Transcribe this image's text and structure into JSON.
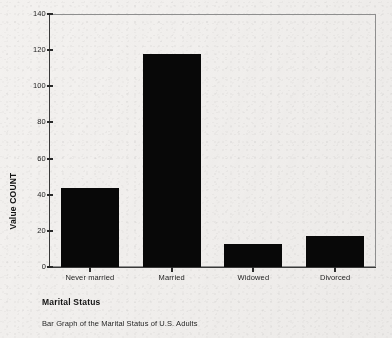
{
  "chart_data": {
    "type": "bar",
    "title": "",
    "caption": "Bar Graph of the Marital Status of U.S. Adults",
    "xlabel": "Marital Status",
    "ylabel": "Value COUNT",
    "categories": [
      "Never married",
      "Married",
      "Widowed",
      "Divorced"
    ],
    "values": [
      44,
      118,
      13,
      17
    ],
    "ylim": [
      0,
      140
    ],
    "yticks": [
      0,
      20,
      40,
      60,
      80,
      100,
      120,
      140
    ],
    "ytick_labels": [
      "0",
      "20",
      "40",
      "60",
      "80",
      "100",
      "120",
      "140"
    ],
    "grid": false,
    "legend": false,
    "bar_color": "#080808",
    "axis_color": "#3a3a3a",
    "frame_color": "#8e8e8e",
    "background_color": "#f3f1ef"
  }
}
